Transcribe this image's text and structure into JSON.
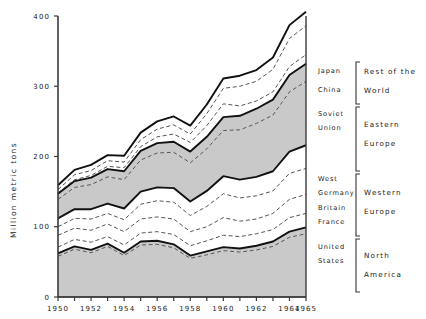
{
  "chart_data": {
    "type": "area",
    "title": "",
    "subtitle": "",
    "xlabel": "",
    "ylabel": "Million metric tons",
    "xlim": [
      1950,
      1965
    ],
    "ylim": [
      0,
      400
    ],
    "xticks": [
      1950,
      1951,
      1952,
      1953,
      1954,
      1955,
      1956,
      1957,
      1958,
      1959,
      1960,
      1961,
      1962,
      1963,
      1964,
      1965
    ],
    "xticklabels": [
      "1950",
      "",
      "1952",
      "",
      "1954",
      "",
      "1956",
      "",
      "1958",
      "",
      "1960",
      "",
      "1962",
      "",
      "1964",
      "1965"
    ],
    "yticks": [
      0,
      100,
      200,
      300,
      400
    ],
    "yticklabels": [
      "0",
      "100",
      "200",
      "300",
      "400"
    ],
    "grid": false,
    "legend_position": "right",
    "stacked": true,
    "x": [
      1950,
      1951,
      1952,
      1953,
      1954,
      1955,
      1956,
      1957,
      1958,
      1959,
      1960,
      1961,
      1962,
      1963,
      1964,
      1965
    ],
    "series": [
      {
        "name": "United States",
        "group": "North America",
        "fill": "shaded",
        "values": [
          58,
          68,
          63,
          72,
          59,
          74,
          75,
          70,
          55,
          60,
          66,
          64,
          67,
          72,
          85,
          90
        ]
      },
      {
        "name": "Canada",
        "group": "North America",
        "fill": "shaded-top",
        "values": [
          4,
          4,
          4,
          4,
          4,
          5,
          5,
          5,
          4,
          5,
          5,
          5,
          6,
          7,
          8,
          9
        ]
      },
      {
        "name": "France",
        "group": "Western Europe",
        "fill": "white",
        "values": [
          9,
          10,
          11,
          10,
          11,
          12,
          13,
          14,
          14,
          15,
          17,
          17,
          17,
          17,
          20,
          20
        ]
      },
      {
        "name": "Britain",
        "group": "Western Europe",
        "fill": "white",
        "values": [
          17,
          16,
          17,
          18,
          19,
          20,
          21,
          22,
          20,
          20,
          25,
          22,
          21,
          23,
          26,
          27
        ]
      },
      {
        "name": "West Germany",
        "group": "Western Europe",
        "fill": "white",
        "values": [
          12,
          14,
          16,
          15,
          17,
          21,
          23,
          24,
          23,
          29,
          34,
          33,
          33,
          32,
          37,
          37
        ]
      },
      {
        "name": "Other Western Europe",
        "group": "Western Europe",
        "fill": "white",
        "values": [
          12,
          13,
          14,
          14,
          16,
          18,
          19,
          20,
          20,
          22,
          25,
          26,
          27,
          28,
          31,
          33
        ]
      },
      {
        "name": "Soviet Union",
        "group": "Eastern Europe",
        "fill": "shaded",
        "values": [
          27,
          31,
          35,
          38,
          41,
          45,
          49,
          51,
          55,
          60,
          65,
          71,
          76,
          80,
          85,
          91
        ]
      },
      {
        "name": "Other Eastern Europe",
        "group": "Eastern Europe",
        "fill": "shaded",
        "values": [
          8,
          9,
          10,
          11,
          12,
          13,
          14,
          15,
          16,
          17,
          19,
          20,
          21,
          22,
          24,
          25
        ]
      },
      {
        "name": "China",
        "group": "Rest of the World",
        "fill": "white",
        "values": [
          1,
          2,
          3,
          4,
          5,
          6,
          9,
          11,
          13,
          16,
          19,
          14,
          11,
          11,
          12,
          13
        ]
      },
      {
        "name": "Japan",
        "group": "Rest of the World",
        "fill": "white",
        "values": [
          5,
          7,
          7,
          8,
          8,
          10,
          11,
          13,
          12,
          17,
          22,
          28,
          28,
          32,
          40,
          41
        ]
      },
      {
        "name": "Other Rest of the World",
        "group": "Rest of the World",
        "fill": "white",
        "values": [
          6,
          7,
          8,
          8,
          9,
          10,
          11,
          12,
          12,
          13,
          14,
          15,
          16,
          17,
          19,
          20
        ]
      }
    ],
    "totals": [
      159,
      181,
      188,
      202,
      201,
      234,
      250,
      257,
      244,
      274,
      311,
      315,
      323,
      341,
      387,
      406
    ]
  },
  "yaxis": {
    "label": "Million metric tons",
    "ticks": [
      "400",
      "300",
      "200",
      "100",
      "0"
    ]
  },
  "xaxis": {
    "labels": [
      "1950",
      "1952",
      "1954",
      "1956",
      "1958",
      "1960",
      "1962",
      "1964",
      "1965"
    ]
  },
  "legend": {
    "countries": [
      "Japan",
      "China",
      "Soviet",
      "Union",
      "West",
      "Germany",
      "Britain",
      "France",
      "United",
      "States"
    ],
    "items": [
      {
        "label": "Japan"
      },
      {
        "label": "China"
      },
      {
        "label": "Soviet"
      },
      {
        "label": "Union"
      },
      {
        "label": "West"
      },
      {
        "label": "Germany"
      },
      {
        "label": "Britain"
      },
      {
        "label": "France"
      },
      {
        "label": "United"
      },
      {
        "label": "States"
      }
    ],
    "groups": [
      {
        "line1": "Rest of the",
        "line2": "World"
      },
      {
        "line1": "Eastern",
        "line2": "Europe"
      },
      {
        "line1": "Western",
        "line2": "Europe"
      },
      {
        "line1": "North",
        "line2": "America"
      }
    ]
  },
  "colors": {
    "shaded": "#c9c9c9",
    "white": "#ffffff",
    "line": "#111111",
    "dashed": "#555555",
    "axis": "#3a3a3a",
    "text": "#222222"
  }
}
